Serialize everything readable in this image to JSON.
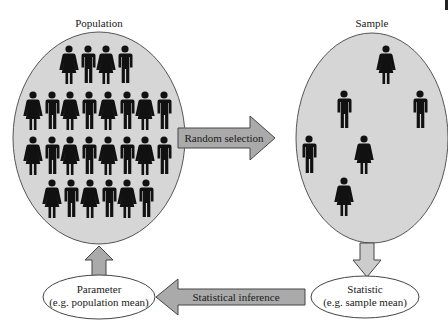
{
  "population": {
    "title": "Population",
    "fill": "#d6d6d6",
    "figures": [
      {
        "row": 1,
        "types": [
          "female",
          "male",
          "female",
          "male"
        ]
      },
      {
        "row": 2,
        "types": [
          "female",
          "male",
          "female",
          "male",
          "female",
          "male",
          "female",
          "male"
        ]
      },
      {
        "row": 3,
        "types": [
          "female",
          "male",
          "female",
          "male",
          "female",
          "male",
          "female",
          "male"
        ]
      },
      {
        "row": 4,
        "types": [
          "female",
          "male",
          "female",
          "male",
          "female",
          "male"
        ]
      }
    ]
  },
  "sample": {
    "title": "Sample",
    "fill": "#d6d6d6",
    "figures": [
      "female",
      "male",
      "male",
      "male",
      "female",
      "female"
    ]
  },
  "arrows": {
    "random_selection": "Random selection",
    "statistical_inference": "Statistical inference",
    "fill": "#aaaaaa"
  },
  "parameter": {
    "line1": "Parameter",
    "line2": "(e.g. population mean)"
  },
  "statistic": {
    "line1": "Statistic",
    "line2": "(e.g. sample mean)"
  }
}
